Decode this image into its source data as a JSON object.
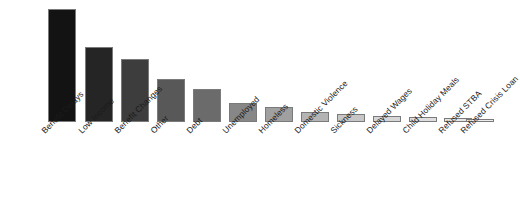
{
  "chart_data": {
    "type": "bar",
    "title": "",
    "subtitle": "",
    "xlabel": "",
    "ylabel": "",
    "legend": [],
    "grid": false,
    "axis_visible": false,
    "ylim": [
      0,
      118
    ],
    "label_rotation_deg": -45,
    "categories": [
      "Benefit Delays",
      "Low Income",
      "Benefit Changes",
      "Other",
      "Debt",
      "Unemployed",
      "Homeless",
      "Domestic Violence",
      "Sickness",
      "Delayed Wages",
      "Child Holiday Meals",
      "Refused STBA",
      "Refused Crisis Loan"
    ],
    "values": [
      116,
      77,
      65,
      44,
      34,
      19,
      15,
      10,
      8,
      6,
      5,
      4,
      3
    ],
    "bar_colors": [
      "#131313",
      "#252525",
      "#3d3d3d",
      "#585858",
      "#6b6b6b",
      "#878787",
      "#a0a0a0",
      "#b4b4b4",
      "#c6c6c6",
      "#d6d6d6",
      "#dedede",
      "#e6e6e6",
      "#ededed"
    ],
    "bar_edge_color": "#7a7a7a",
    "background_color": "#ffffff",
    "text_color": "#1b1b1b"
  }
}
